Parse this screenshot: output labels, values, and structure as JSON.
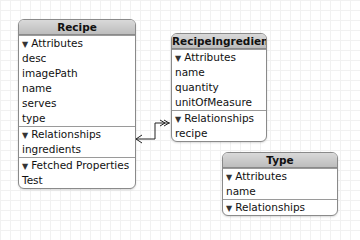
{
  "entities": {
    "recipe": {
      "title": "Recipe",
      "attributes_header": "Attributes",
      "attributes": [
        "desc",
        "imagePath",
        "name",
        "serves",
        "type"
      ],
      "relationships_header": "Relationships",
      "relationships": [
        "ingredients"
      ],
      "fetched_header": "Fetched Properties",
      "fetched": [
        "Test"
      ]
    },
    "recipe_ingredient": {
      "title": "RecipeIngredient",
      "attributes_header": "Attributes",
      "attributes": [
        "name",
        "quantity",
        "unitOfMeasure"
      ],
      "relationships_header": "Relationships",
      "relationships": [
        "recipe"
      ]
    },
    "type": {
      "title": "Type",
      "attributes_header": "Attributes",
      "attributes": [
        "name"
      ],
      "relationships_header": "Relationships"
    }
  },
  "icons": {
    "disclosure": "▼"
  },
  "colors": {
    "title_bg": "#c8c8c8",
    "border": "#8a8a8a",
    "grid": "#f1f1f1"
  }
}
